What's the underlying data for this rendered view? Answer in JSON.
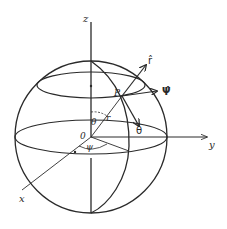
{
  "figure": {
    "colors": {
      "stroke": "#2a2a2a",
      "background": "#ffffff"
    },
    "axes": {
      "z": {
        "label": "z"
      },
      "y": {
        "label": "y"
      },
      "x": {
        "label": "x"
      }
    },
    "points": {
      "origin": {
        "label": "0"
      },
      "p": {
        "label": "P"
      }
    },
    "quantities": {
      "radius": {
        "label": "r"
      },
      "polar_angle": {
        "label": "θ"
      },
      "azimuth_angle": {
        "label": "ψ"
      }
    },
    "unit_vectors": {
      "r_hat": {
        "label": "r̂"
      },
      "psi_hat": {
        "label": "Ψ̂"
      },
      "theta_hat": {
        "label": "θ̂"
      }
    }
  }
}
